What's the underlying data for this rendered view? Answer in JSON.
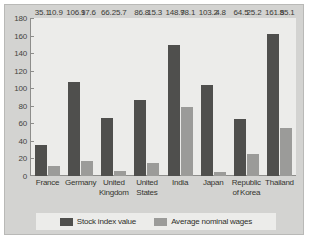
{
  "chart_data": {
    "type": "bar",
    "title": "",
    "xlabel": "",
    "ylabel": "",
    "ylim": [
      0,
      180
    ],
    "ytick_step": 20,
    "yticks": [
      180,
      160,
      140,
      120,
      100,
      80,
      60,
      40,
      20,
      0
    ],
    "grid": false,
    "legend_position": "bottom",
    "categories": [
      "France",
      "Germany",
      "United Kingdom",
      "United States",
      "India",
      "Japan",
      "Republic of Korea",
      "Thailand"
    ],
    "category_lines": [
      [
        "France"
      ],
      [
        "Germany"
      ],
      [
        "United",
        "Kingdom"
      ],
      [
        "United",
        "States"
      ],
      [
        "India"
      ],
      [
        "Japan"
      ],
      [
        "Republic",
        "of Korea"
      ],
      [
        "Thailand"
      ]
    ],
    "series": [
      {
        "name": "Stock index value",
        "color": "#4f4f4d",
        "values": [
          35.1,
          106.9,
          66.2,
          86.8,
          148.9,
          103.2,
          64.5,
          161.8
        ],
        "labels": [
          "35.1",
          "106.9",
          "66.2",
          "86.8",
          "148.9",
          "103.2",
          "64.5",
          "161.8"
        ]
      },
      {
        "name": "Average nominal wages",
        "color": "#9b9b99",
        "values": [
          10.9,
          17.6,
          5.7,
          15.3,
          78.1,
          4.8,
          25.2,
          55.1
        ],
        "labels": [
          "10.9",
          "17.6",
          "5.7",
          "15.3",
          "78.1",
          "4.8",
          "25.2",
          "55.1"
        ]
      }
    ]
  },
  "legend": {
    "items": [
      {
        "label": "Stock index value"
      },
      {
        "label": "Average nominal wages"
      }
    ]
  },
  "colors": {
    "series_dark": "#4f4f4d",
    "series_light": "#9b9b99",
    "figure_background": "#d3d3d1",
    "plot_background": "#ececea",
    "axis_line": "#8d8d8b"
  }
}
